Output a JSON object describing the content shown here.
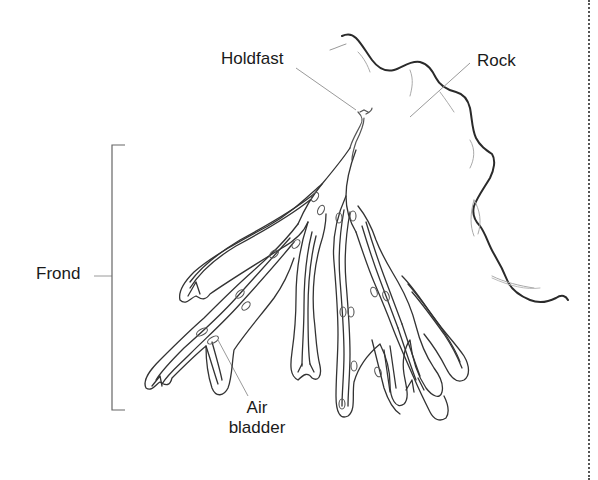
{
  "diagram": {
    "labels": {
      "holdfast": "Holdfast",
      "rock": "Rock",
      "frond": "Frond",
      "air_bladder_line1": "Air",
      "air_bladder_line2": "bladder"
    },
    "colors": {
      "outline": "#333333",
      "rock_outline": "#2a2a2a",
      "leader_line": "#9a9a9a",
      "text": "#1a1a1a",
      "background": "#ffffff"
    }
  }
}
